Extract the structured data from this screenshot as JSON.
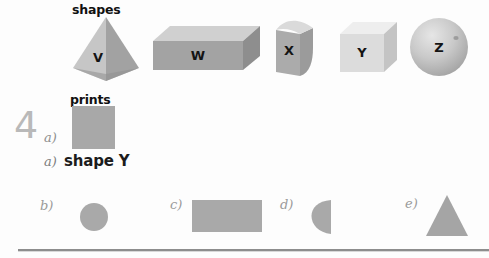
{
  "worksheet": {
    "headings": {
      "shapes": "shapes",
      "prints": "prints"
    },
    "question": {
      "number": "4",
      "part": "a)"
    },
    "answer": {
      "letter": "a)",
      "text": "shape Y"
    },
    "solids": [
      {
        "id": "solid-v",
        "letter": "V",
        "form": "pyramid",
        "fill": "#b4b4b4",
        "fill_light": "#cfcfcf",
        "fill_dark": "#9c9c9c"
      },
      {
        "id": "solid-w",
        "letter": "W",
        "form": "cuboid",
        "fill": "#a9a9a9",
        "fill_light": "#cbcbcb",
        "fill_dark": "#989898"
      },
      {
        "id": "solid-x",
        "letter": "X",
        "form": "quarter-cylinder",
        "fill": "#b0b0b0",
        "fill_light": "#d3d3d3",
        "fill_dark": "#a0a0a0"
      },
      {
        "id": "solid-y",
        "letter": "Y",
        "form": "cube",
        "fill": "#dcdcdc",
        "fill_light": "#eeeeee",
        "fill_dark": "#cccccc"
      },
      {
        "id": "solid-z",
        "letter": "Z",
        "form": "sphere",
        "fill": "#c6c6c6",
        "fill_light": "#e8e8e8",
        "fill_dark": "#a8a8a8"
      }
    ],
    "prints": [
      {
        "id": "print-a",
        "option": "",
        "form": "square",
        "fill": "#a8a8a8"
      },
      {
        "id": "print-b",
        "option": "b)",
        "form": "circle",
        "fill": "#a9a9a9"
      },
      {
        "id": "print-c",
        "option": "c)",
        "form": "rectangle",
        "fill": "#a9a9a9"
      },
      {
        "id": "print-d",
        "option": "d)",
        "form": "semicircle",
        "fill": "#a9a9a9"
      },
      {
        "id": "print-e",
        "option": "e)",
        "form": "triangle",
        "fill": "#a5a5a5"
      }
    ],
    "colors": {
      "page_background": "#fdfdfd",
      "rule": "#8d8d8d",
      "ink": "#1a1a1a",
      "muted_ink": "#9a9a9a"
    }
  }
}
